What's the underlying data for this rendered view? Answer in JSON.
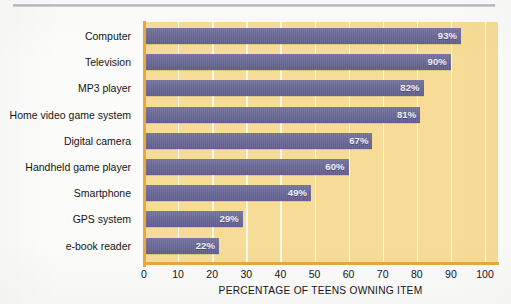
{
  "figure": {
    "background_color": "#fbfbfa",
    "top_rule_color": "#b6bec8"
  },
  "plot": {
    "background_color": "#f6dc96",
    "axis_color": "#e9a838",
    "gridline_color": "#fdfaf0",
    "bar_color": "#6d6c9b",
    "value_label_color": "#f2f0f7"
  },
  "chart_data": {
    "type": "bar",
    "orientation": "horizontal",
    "title": "",
    "subtitle": "",
    "xlabel": "PERCENTAGE OF TEENS OWNING ITEM",
    "ylabel": "",
    "xlim": [
      0,
      100
    ],
    "xticks": [
      0,
      10,
      20,
      30,
      40,
      50,
      60,
      70,
      80,
      90,
      100
    ],
    "xtick_labels": [
      "0",
      "10",
      "20",
      "30",
      "40",
      "50",
      "60",
      "70",
      "80",
      "90",
      "100"
    ],
    "grid": true,
    "grid_axis": "x",
    "legend": false,
    "legend_position": "none",
    "categories": [
      "Computer",
      "Television",
      "MP3 player",
      "Home video game system",
      "Digital camera",
      "Handheld game player",
      "Smartphone",
      "GPS system",
      "e-book reader"
    ],
    "values": [
      93,
      90,
      82,
      81,
      67,
      60,
      49,
      29,
      22
    ],
    "value_labels": [
      "93%",
      "90%",
      "82%",
      "81%",
      "67%",
      "60%",
      "49%",
      "29%",
      "22%"
    ],
    "annotations": []
  }
}
